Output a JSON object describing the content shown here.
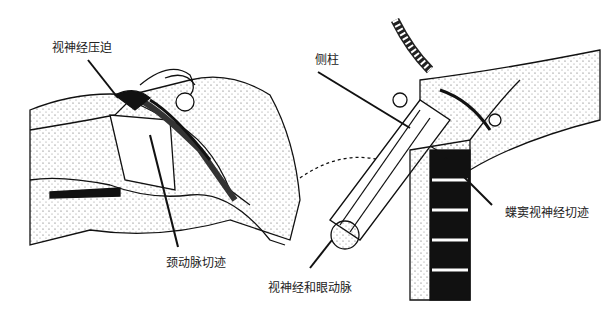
{
  "labels": {
    "optic_compression": "视神经压迫",
    "carotid_notch": "颈动脉切迹",
    "lateral_column": "侧柱",
    "optic_ophthalmic": "视神经和眼动脉",
    "sphenoid_optic_notch": "蝶窦视神经切迹"
  }
}
